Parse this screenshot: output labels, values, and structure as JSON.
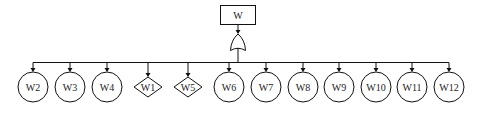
{
  "diagram": {
    "type": "fault-tree",
    "top_event": {
      "label": "W",
      "shape": "rectangle"
    },
    "gate": {
      "type": "OR",
      "shape": "or-gate"
    },
    "children": [
      {
        "label": "W2",
        "shape": "circle"
      },
      {
        "label": "W3",
        "shape": "circle"
      },
      {
        "label": "W4",
        "shape": "circle"
      },
      {
        "label": "W1",
        "shape": "diamond"
      },
      {
        "label": "W5",
        "shape": "diamond"
      },
      {
        "label": "W6",
        "shape": "circle"
      },
      {
        "label": "W7",
        "shape": "circle"
      },
      {
        "label": "W8",
        "shape": "circle"
      },
      {
        "label": "W9",
        "shape": "circle"
      },
      {
        "label": "W10",
        "shape": "circle"
      },
      {
        "label": "W11",
        "shape": "circle"
      },
      {
        "label": "W12",
        "shape": "circle"
      }
    ]
  }
}
